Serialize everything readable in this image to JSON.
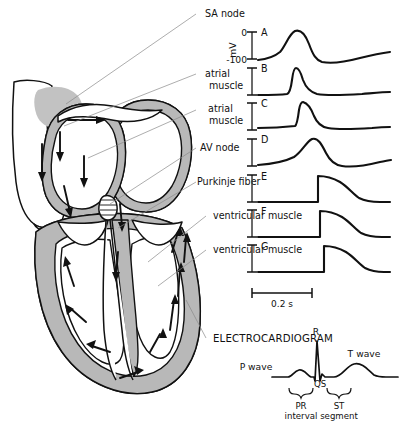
{
  "axis": {
    "unit_label": "mV",
    "top_tick_label": "0",
    "bottom_tick_label": "-100",
    "time_scale_label": "0.2 s"
  },
  "traces": [
    {
      "id": "A",
      "label": "SA node",
      "shape": "pacemaker-slow-upstroke"
    },
    {
      "id": "B",
      "label": "atrial muscle",
      "shape": "fast-upstroke-short-plateau"
    },
    {
      "id": "C",
      "label": "atrial muscle",
      "shape": "fast-upstroke-sloped-decay"
    },
    {
      "id": "D",
      "label": "AV node",
      "shape": "slow-rounded"
    },
    {
      "id": "E",
      "label": "Purkinje fiber",
      "shape": "fast-upstroke-long-plateau"
    },
    {
      "id": "F",
      "label": "ventricular muscle",
      "shape": "fast-upstroke-long-plateau"
    },
    {
      "id": "G",
      "label": "ventricular muscle",
      "shape": "fast-upstroke-long-plateau"
    }
  ],
  "ecg": {
    "title": "ELECTROCARDIOGRAM",
    "p_wave_label": "P wave",
    "r_label": "R",
    "qs_label": "QS",
    "t_wave_label": "T wave",
    "pr_interval_line1": "PR",
    "pr_interval_line2": "interval",
    "st_segment_line1": "ST",
    "st_segment_line2": "segment"
  },
  "colors": {
    "ink": "#111111",
    "myocardium_gray": "#b8b8b8",
    "sa_node_gray": "#c2c2c2",
    "leader_gray": "#8a8a8a",
    "background": "#ffffff"
  }
}
